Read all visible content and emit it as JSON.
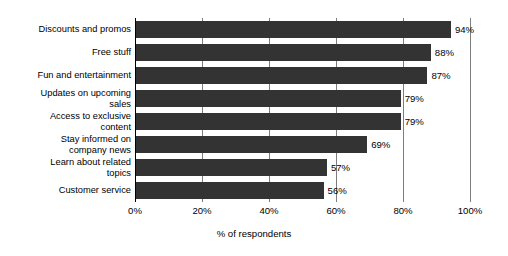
{
  "chart_data": {
    "type": "bar",
    "orientation": "horizontal",
    "title": "",
    "xlabel": "% of respondents",
    "ylabel": "",
    "xlim": [
      0,
      100
    ],
    "xticks": [
      0,
      20,
      40,
      60,
      80,
      100
    ],
    "xtick_labels": [
      "0%",
      "20%",
      "40%",
      "60%",
      "80%",
      "100%"
    ],
    "grid": true,
    "grid_axis": "x",
    "legend": false,
    "value_label_suffix": "%",
    "bar_color": "#333333",
    "gridline_color": "#7d7d7d",
    "axis_color": "#000000",
    "background_color": "#ffffff",
    "categories": [
      "Discounts and promos",
      "Free stuff",
      "Fun and entertainment",
      "Updates on upcoming sales",
      "Access to exclusive content",
      "Stay informed on company news",
      "Learn about related topics",
      "Customer service"
    ],
    "values": [
      94,
      88,
      87,
      79,
      79,
      69,
      57,
      56
    ],
    "value_labels": [
      "94%",
      "88%",
      "87%",
      "79%",
      "79%",
      "69%",
      "57%",
      "56%"
    ],
    "bars": [
      {
        "category": "Discounts and promos",
        "category_display": "Discounts and promos",
        "value": 94,
        "label": "94%"
      },
      {
        "category": "Free stuff",
        "category_display": "Free stuff",
        "value": 88,
        "label": "88%"
      },
      {
        "category": "Fun and entertainment",
        "category_display": "Fun and entertainment",
        "value": 87,
        "label": "87%"
      },
      {
        "category": "Updates on upcoming sales",
        "category_display": "Updates on upcoming\nsales",
        "value": 79,
        "label": "79%"
      },
      {
        "category": "Access to exclusive content",
        "category_display": "Access to exclusive\ncontent",
        "value": 79,
        "label": "79%"
      },
      {
        "category": "Stay informed on company news",
        "category_display": "Stay informed on\ncompany news",
        "value": 69,
        "label": "69%"
      },
      {
        "category": "Learn about related topics",
        "category_display": "Learn about related\ntopics",
        "value": 57,
        "label": "57%"
      },
      {
        "category": "Customer service",
        "category_display": "Customer service",
        "value": 56,
        "label": "56%"
      }
    ]
  }
}
